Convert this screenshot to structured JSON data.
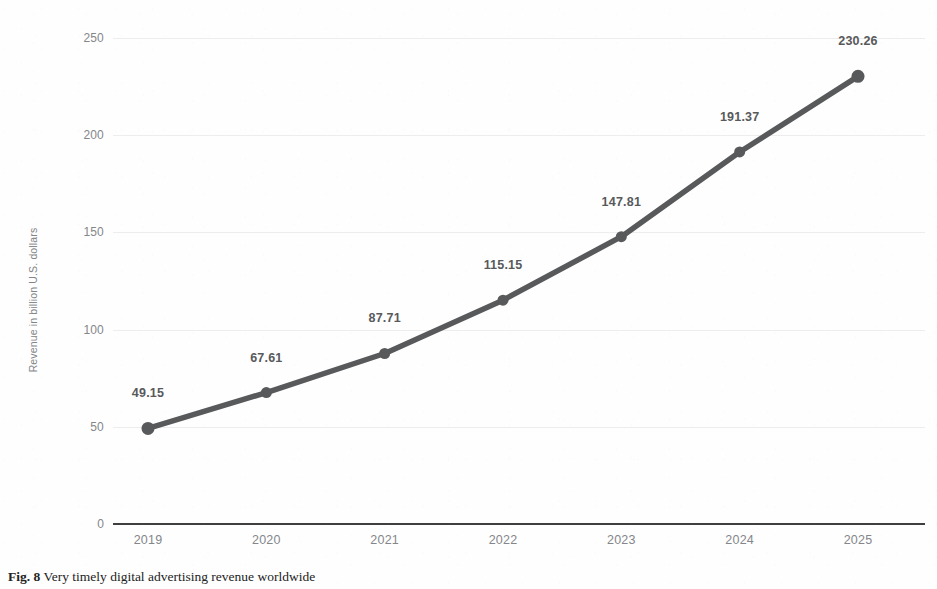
{
  "chart_data": {
    "type": "line",
    "title": "",
    "xlabel": "",
    "ylabel": "Revenue in billion U.S. dollars",
    "categories": [
      "2019",
      "2020",
      "2021",
      "2022",
      "2023",
      "2024",
      "2025"
    ],
    "values": [
      49.15,
      67.61,
      87.71,
      115.15,
      147.81,
      191.37,
      230.26
    ],
    "point_labels": [
      "49.15",
      "67.61",
      "87.71",
      "115.15",
      "147.81",
      "191.37",
      "230.26"
    ],
    "ylim": [
      0,
      250
    ],
    "yticks": [
      0,
      50,
      100,
      150,
      200,
      250
    ],
    "ytick_labels": [
      "0",
      "50",
      "100",
      "150",
      "200",
      "250"
    ],
    "grid": true,
    "legend": false,
    "series_color": "#58595b",
    "gridline_color": "#ededee",
    "axis_color": "#3f3f3f",
    "tick_label_color": "#84868a",
    "marker": "circle"
  },
  "caption": {
    "fig_label": "Fig. 8",
    "text": "Very timely digital advertising revenue worldwide"
  }
}
